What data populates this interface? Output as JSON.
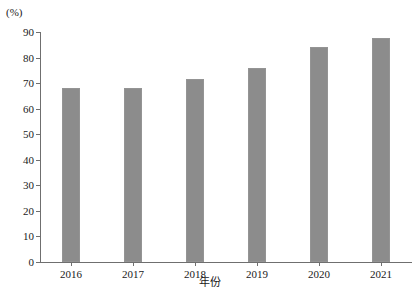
{
  "chart_data": {
    "type": "bar",
    "title": "",
    "subtitle": "",
    "unit_label": "(%)",
    "xlabel": "年份",
    "ylabel": "",
    "categories": [
      "2016",
      "2017",
      "2018",
      "2019",
      "2020",
      "2021"
    ],
    "values": [
      68,
      68,
      71.5,
      76,
      84,
      87.5
    ],
    "series": [
      {
        "name": "",
        "values": [
          68,
          68,
          71.5,
          76,
          84,
          87.5
        ]
      }
    ],
    "ylim": [
      0,
      90
    ],
    "ytick_labels": [
      "0",
      "10",
      "20",
      "30",
      "40",
      "50",
      "60",
      "70",
      "80",
      "90"
    ],
    "ytick_values": [
      0,
      10,
      20,
      30,
      40,
      50,
      60,
      70,
      80,
      90
    ],
    "grid": false,
    "legend": null,
    "legend_position": "none",
    "bar_color": "#8c8c8c",
    "axis_color": "#6f6f6f",
    "background": "#ffffff"
  }
}
